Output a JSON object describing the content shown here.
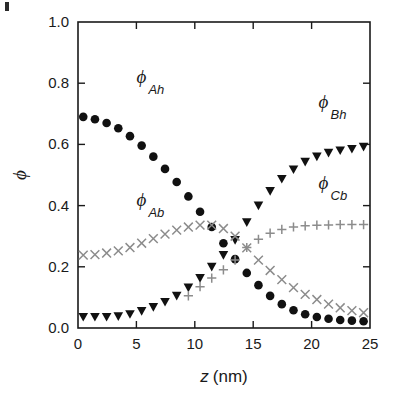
{
  "figure": {
    "background_color": "#ffffff",
    "foreground_color": "#1a1a1a",
    "faint_color": "#8c8c8c"
  },
  "chart_data": {
    "type": "scatter",
    "title": "",
    "xlabel": "z (nm)",
    "xlabel_italic_part": "z",
    "xlabel_unit_part": "(nm)",
    "ylabel": "ϕ",
    "xlim": [
      0,
      25
    ],
    "ylim": [
      0,
      1.0
    ],
    "xticks": [
      0,
      5,
      10,
      15,
      20,
      25
    ],
    "xtick_labels": [
      "0",
      "5",
      "10",
      "15",
      "20",
      "25"
    ],
    "yticks": [
      0.0,
      0.2,
      0.4,
      0.6,
      0.8,
      1.0
    ],
    "ytick_labels": [
      "0.0",
      "0.2",
      "0.4",
      "0.6",
      "0.8",
      "1.0"
    ],
    "grid": false,
    "legend_position": "inline-annotations",
    "series": [
      {
        "name": "ϕ_Ah",
        "label_base": "ϕ",
        "label_sub": "Ah",
        "marker": "filled-circle",
        "color": "#111111",
        "label_x": 5.0,
        "label_y": 0.8,
        "x": [
          0.45,
          1.45,
          2.45,
          3.45,
          4.45,
          5.45,
          6.45,
          7.45,
          8.45,
          9.45,
          10.45,
          11.45,
          12.45,
          13.45,
          14.45,
          15.45,
          16.45,
          17.45,
          18.45,
          19.45,
          20.45,
          21.45,
          22.45,
          23.45,
          24.45
        ],
        "y": [
          0.69,
          0.682,
          0.67,
          0.653,
          0.627,
          0.596,
          0.56,
          0.52,
          0.477,
          0.43,
          0.38,
          0.33,
          0.277,
          0.225,
          0.18,
          0.14,
          0.105,
          0.078,
          0.058,
          0.045,
          0.036,
          0.03,
          0.026,
          0.024,
          0.022
        ]
      },
      {
        "name": "ϕ_Bh",
        "label_base": "ϕ",
        "label_sub": "Bh",
        "marker": "filled-triangle-down",
        "color": "#111111",
        "label_x": 20.6,
        "label_y": 0.72,
        "x": [
          0.45,
          1.45,
          2.45,
          3.45,
          4.45,
          5.45,
          6.45,
          7.45,
          8.45,
          9.45,
          10.45,
          11.45,
          12.45,
          13.45,
          14.45,
          15.45,
          16.45,
          17.45,
          18.45,
          19.45,
          20.45,
          21.45,
          22.45,
          23.45,
          24.45
        ],
        "y": [
          0.036,
          0.036,
          0.036,
          0.038,
          0.045,
          0.055,
          0.068,
          0.085,
          0.105,
          0.132,
          0.163,
          0.2,
          0.238,
          0.287,
          0.345,
          0.4,
          0.447,
          0.487,
          0.518,
          0.543,
          0.56,
          0.572,
          0.58,
          0.585,
          0.592
        ]
      },
      {
        "name": "ϕ_Ab",
        "label_base": "ϕ",
        "label_sub": "Ab",
        "marker": "cross-x",
        "color": "#8c8c8c",
        "label_x": 5.0,
        "label_y": 0.4,
        "x": [
          0.45,
          1.45,
          2.45,
          3.45,
          4.45,
          5.45,
          6.45,
          7.45,
          8.45,
          9.45,
          10.45,
          11.45,
          12.45,
          13.45,
          14.45,
          15.45,
          16.45,
          17.45,
          18.45,
          19.45,
          20.45,
          21.45,
          22.45,
          23.45,
          24.45
        ],
        "y": [
          0.238,
          0.24,
          0.245,
          0.252,
          0.263,
          0.277,
          0.292,
          0.307,
          0.32,
          0.33,
          0.336,
          0.336,
          0.325,
          0.3,
          0.262,
          0.222,
          0.188,
          0.158,
          0.132,
          0.11,
          0.093,
          0.078,
          0.066,
          0.057,
          0.05
        ]
      },
      {
        "name": "ϕ_Cb",
        "label_base": "ϕ",
        "label_sub": "Cb",
        "marker": "plus",
        "color": "#8c8c8c",
        "label_x": 20.6,
        "label_y": 0.455,
        "x": [
          9.45,
          10.45,
          11.45,
          12.45,
          13.45,
          14.45,
          15.45,
          16.45,
          17.45,
          18.45,
          19.45,
          20.45,
          21.45,
          22.45,
          23.45,
          24.45
        ],
        "y": [
          0.105,
          0.135,
          0.163,
          0.19,
          0.222,
          0.263,
          0.29,
          0.31,
          0.322,
          0.33,
          0.334,
          0.336,
          0.337,
          0.338,
          0.338,
          0.338
        ]
      }
    ]
  }
}
